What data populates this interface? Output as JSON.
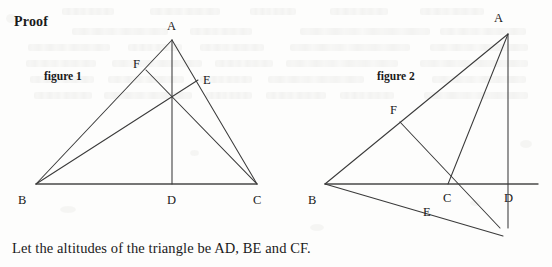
{
  "page": {
    "heading": "Proof",
    "caption_text": "Let the altitudes of the triangle be AD, BE and CF.",
    "background_color": "#fdfdfc",
    "ink_color": "#3a3a3a"
  },
  "figure1": {
    "caption": "figure 1",
    "labels": {
      "A": "A",
      "B": "B",
      "C": "C",
      "D": "D",
      "E": "E",
      "F": "F"
    },
    "points": {
      "A": [
        172,
        40
      ],
      "B": [
        36,
        184
      ],
      "C": [
        257,
        184
      ],
      "D": [
        172,
        184
      ],
      "E": [
        198,
        80
      ],
      "F": [
        146,
        70
      ]
    },
    "segments": [
      [
        "B",
        "C"
      ],
      [
        "A",
        "B"
      ],
      [
        "A",
        "C"
      ],
      [
        "A",
        "D"
      ],
      [
        "B",
        "E"
      ],
      [
        "C",
        "F"
      ]
    ],
    "triangle_type": "acute"
  },
  "figure2": {
    "caption": "figure 2",
    "labels": {
      "A": "A",
      "B": "B",
      "C": "C",
      "D": "D",
      "E": "E",
      "F": "F"
    },
    "points": {
      "A": [
        508,
        34
      ],
      "B": [
        325,
        184
      ],
      "C": [
        448,
        184
      ],
      "D": [
        508,
        184
      ],
      "E": [
        437,
        211
      ],
      "F": [
        400,
        122
      ]
    },
    "extensions": {
      "BC_right_end": [
        538,
        184
      ],
      "BE_extended": [
        500,
        228
      ],
      "CF_extended": [
        503,
        236
      ]
    },
    "segments": [
      [
        "B",
        "D_line"
      ],
      [
        "A",
        "B"
      ],
      [
        "A",
        "C"
      ],
      [
        "A",
        "D"
      ],
      [
        "B",
        "E_ext"
      ],
      [
        "C",
        "F_ext"
      ]
    ],
    "triangle_type": "obtuse"
  }
}
